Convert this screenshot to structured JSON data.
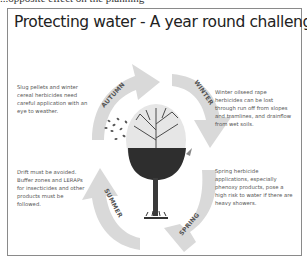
{
  "header": {
    "cut_text": "...opposite effect on the planning"
  },
  "diagram": {
    "title": "Protecting water - A year round challenge",
    "seasons": [
      {
        "name": "AUTUMN",
        "note": "Slug pellets and winter cereal herbicides need careful application with an eye to weather."
      },
      {
        "name": "WINTER",
        "note": "Winter oilseed rape herbicides can be lost through run off from slopes and tramlines, and drainflow from wet soils."
      },
      {
        "name": "SPRING",
        "note": "Spring herbicide applications, especially phenoxy products, pose a high risk to water if there are heavy showers."
      },
      {
        "name": "SUMMER",
        "note": "Drift must be avoided. Buffer zones and LERAPs for insecticides and other products must be followed."
      }
    ],
    "center_icon": "tree-icon",
    "arrow_color": "#d9d9d9",
    "border_color": "#8a8a8a"
  }
}
